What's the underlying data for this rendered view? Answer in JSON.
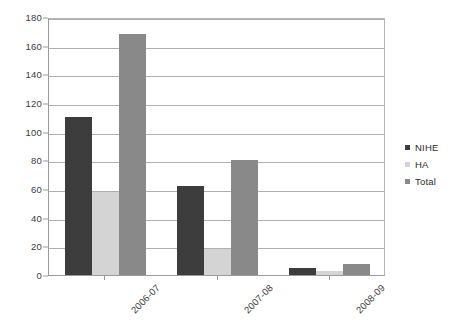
{
  "chart_data": {
    "type": "bar",
    "title": "",
    "subtitle": "",
    "xlabel": "",
    "ylabel": "",
    "categories": [
      "2006-07",
      "2007-08",
      "2008-09"
    ],
    "series": [
      {
        "name": "NIHE",
        "values": [
          110,
          62,
          5
        ],
        "color": "#3d3d3d"
      },
      {
        "name": "HA",
        "values": [
          58,
          18,
          3
        ],
        "color": "#d4d4d4"
      },
      {
        "name": "Total",
        "values": [
          168,
          80,
          8
        ],
        "color": "#898989"
      }
    ],
    "ylim": [
      0,
      180
    ],
    "yticks": [
      0,
      20,
      40,
      60,
      80,
      100,
      120,
      140,
      160,
      180
    ],
    "ytick_labels": [
      "0",
      "20",
      "40",
      "60",
      "80",
      "100",
      "120",
      "140",
      "160",
      "180"
    ],
    "grid": "horizontal",
    "legend_position": "right",
    "legend_entries": [
      "NIHE",
      "HA",
      "Total"
    ],
    "xtick_rotation": -45,
    "bar_layout": "grouped"
  }
}
